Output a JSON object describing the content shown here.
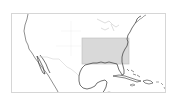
{
  "map": {
    "region": "North America – Southeastern United States, Gulf of Mexico, Caribbean",
    "frame_color": "#d6d6d6",
    "coast_color": "#333333",
    "border_color": "#c8c8c8",
    "highlight": {
      "label": "Southeastern United States",
      "fill": "#d9d9d9",
      "stroke": "#bdbdbd",
      "x": 81,
      "y": 37,
      "width": 47,
      "height": 26
    }
  }
}
